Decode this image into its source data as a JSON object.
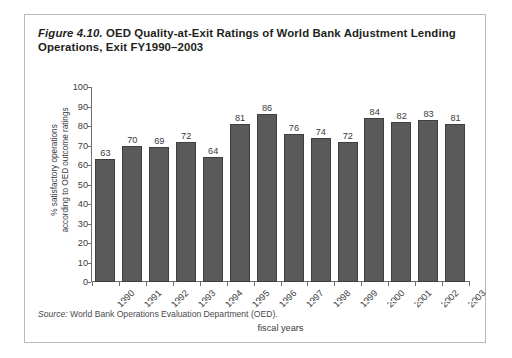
{
  "figure": {
    "number": "Figure 4.10.",
    "title_rest": " OED Quality-at-Exit Ratings of World Bank Adjustment Lending Operations, Exit FY1990–2003",
    "source_word": "Source:",
    "source_text": " World Bank Operations Evaluation Department (OED)."
  },
  "chart_data": {
    "type": "bar",
    "title": "Figure 4.10. OED Quality-at-Exit Ratings of World Bank Adjustment Lending Operations, Exit FY1990–2003",
    "xlabel": "fiscal years",
    "ylabel": "% satisfactory operations according to OED outcome ratings",
    "ylabel_line1": "% satisfactory operations",
    "ylabel_line2": "according to OED outcome ratings",
    "categories": [
      "1990",
      "1991",
      "1992",
      "1993",
      "1994",
      "1995",
      "1996",
      "1997",
      "1998",
      "1999",
      "2000",
      "2001",
      "2002",
      "2003"
    ],
    "values": [
      63,
      70,
      69,
      72,
      64,
      81,
      86,
      76,
      74,
      72,
      84,
      82,
      83,
      81
    ],
    "ylim": [
      0,
      100
    ],
    "yticks": [
      0,
      10,
      20,
      30,
      40,
      50,
      60,
      70,
      80,
      90,
      100
    ],
    "ytick_labels": [
      "0",
      "10",
      "20",
      "30",
      "40",
      "50",
      "60",
      "70",
      "80",
      "90",
      "100"
    ],
    "grid": false,
    "legend": false,
    "bar_color": "#5a5a5a",
    "bar_edge_color": "#3f3f3f",
    "axis_color": "#6f6f72",
    "text_color": "#3a3a3c",
    "data_labels": true
  }
}
